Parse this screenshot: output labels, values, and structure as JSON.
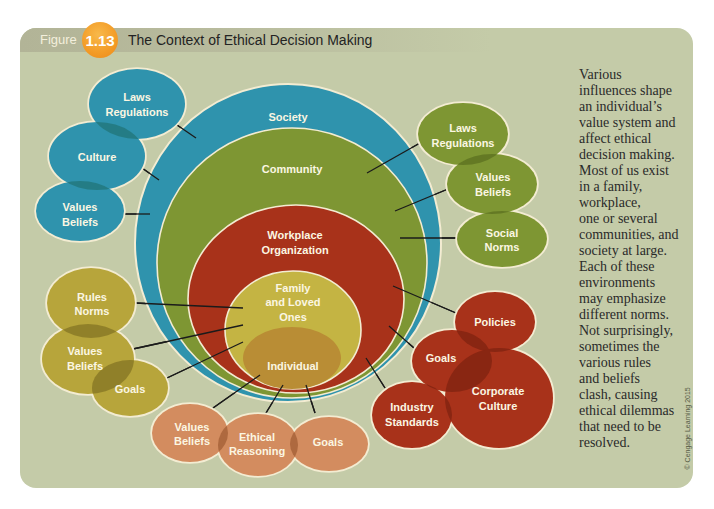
{
  "figure": {
    "label": "Figure",
    "number": "1.13",
    "title": "The Context of Ethical Decision Making",
    "badge_color": "#f39b26"
  },
  "diagram": {
    "concentric": {
      "society": {
        "lines": [
          "Society"
        ],
        "color": "#2f93ad"
      },
      "community": {
        "lines": [
          "Community"
        ],
        "color": "#7e9633"
      },
      "workplace": {
        "lines": [
          "Workplace",
          "Organization"
        ],
        "color": "#a8321a"
      },
      "family": {
        "lines": [
          "Family",
          "and Loved",
          "Ones"
        ],
        "color": "#c4b443"
      },
      "individual": {
        "lines": [
          "Individual"
        ],
        "color": "#b98d35"
      }
    },
    "society_influences": [
      {
        "lines": [
          "Laws",
          "Regulations"
        ]
      },
      {
        "lines": [
          "Culture"
        ]
      },
      {
        "lines": [
          "Values",
          "Beliefs"
        ]
      }
    ],
    "community_influences": [
      {
        "lines": [
          "Laws",
          "Regulations"
        ]
      },
      {
        "lines": [
          "Values",
          "Beliefs"
        ]
      },
      {
        "lines": [
          "Social",
          "Norms"
        ]
      }
    ],
    "family_influences": [
      {
        "lines": [
          "Rules",
          "Norms"
        ]
      },
      {
        "lines": [
          "Values",
          "Beliefs"
        ]
      },
      {
        "lines": [
          "Goals"
        ]
      }
    ],
    "individual_influences": [
      {
        "lines": [
          "Values",
          "Beliefs"
        ]
      },
      {
        "lines": [
          "Ethical",
          "Reasoning"
        ]
      },
      {
        "lines": [
          "Goals"
        ]
      }
    ],
    "workplace_influences": [
      {
        "lines": [
          "Policies"
        ]
      },
      {
        "lines": [
          "Goals"
        ]
      },
      {
        "lines": [
          "Corporate",
          "Culture"
        ]
      },
      {
        "lines": [
          "Industry",
          "Standards"
        ]
      }
    ],
    "colors": {
      "society": "#2f93ad",
      "community": "#7e9633",
      "workplace": "#a8321a",
      "family_satellites": "#b7a53b",
      "individual_satellites": "#d38c5f",
      "outline": "#f3ecd2",
      "panel": "#c4cba8"
    }
  },
  "caption": {
    "lines": [
      "Various",
      "influences shape",
      "an individual’s",
      "value system and",
      "affect ethical",
      "decision making.",
      "Most of us exist",
      "in a family,",
      "workplace,",
      "one or several",
      "communities, and",
      "society at large.",
      "Each of these",
      "environments",
      "may emphasize",
      "different norms.",
      "Not surprisingly,",
      "sometimes the",
      "various rules",
      "and beliefs",
      "clash, causing",
      "ethical dilemmas",
      "that need to be",
      "resolved."
    ]
  },
  "copyright": "© Cengage Learning 2015"
}
